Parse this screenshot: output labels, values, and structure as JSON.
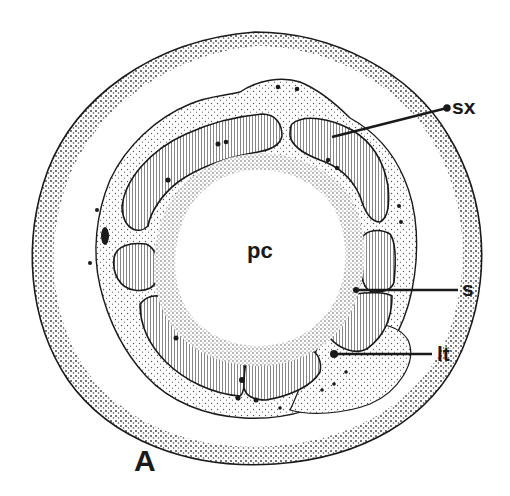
{
  "figure": {
    "panel_label": "A",
    "labels": {
      "secondary_xylem": "sx",
      "pith_cavity": "pc",
      "s": "s",
      "leaf_trace": "lt"
    },
    "colors": {
      "ink": "#1a1a1a",
      "stipple_fill": "#f3f3f3",
      "background": "#ffffff"
    }
  }
}
